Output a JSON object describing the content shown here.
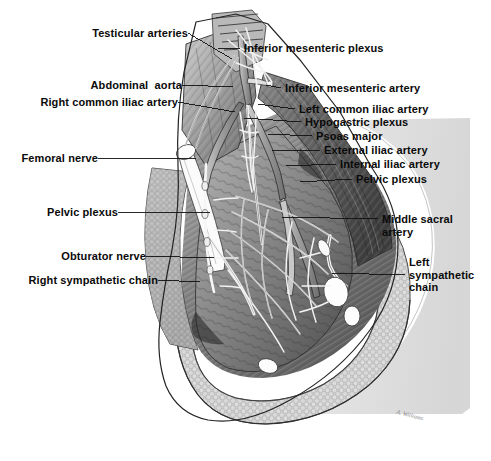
{
  "plate": {
    "title": "Posterior abdominal wall and pelvis — autonomic nerves and arteries",
    "background_color": "#ffffff",
    "ink_color": "#0a0a0a",
    "signature": "A. Williams"
  },
  "labels_left": [
    {
      "id": "testicular-arteries",
      "text": "Testicular arteries",
      "x": 74,
      "y": 27,
      "anchor_x": 188,
      "anchor_y": 33,
      "tip_x": 232,
      "tip_y": 59
    },
    {
      "id": "abdominal-aorta",
      "text": "Abdominal  aorta",
      "x": 85,
      "y": 79,
      "anchor_x": 182,
      "anchor_y": 85,
      "tip_x": 233,
      "tip_y": 87
    },
    {
      "id": "right-common-iliac",
      "text": "Right common iliac artery",
      "x": 21,
      "y": 96,
      "anchor_x": 178,
      "anchor_y": 102,
      "tip_x": 235,
      "tip_y": 112
    },
    {
      "id": "femoral-nerve",
      "text": "Femoral nerve",
      "x": 18,
      "y": 152,
      "anchor_x": 98,
      "anchor_y": 158,
      "tip_x": 196,
      "tip_y": 158
    },
    {
      "id": "pelvic-plexus-left",
      "text": "Pelvic plexus",
      "x": 41,
      "y": 206,
      "anchor_x": 118,
      "anchor_y": 212,
      "tip_x": 210,
      "tip_y": 212
    },
    {
      "id": "obturator-nerve",
      "text": "Obturator nerve",
      "x": 53,
      "y": 250,
      "anchor_x": 146,
      "anchor_y": 256,
      "tip_x": 214,
      "tip_y": 258
    },
    {
      "id": "right-sympathetic-chain",
      "text": "Right sympathetic chain",
      "x": 17,
      "y": 274,
      "anchor_x": 158,
      "anchor_y": 280,
      "tip_x": 200,
      "tip_y": 282
    }
  ],
  "labels_right": [
    {
      "id": "inferior-mesenteric-plexus",
      "text": "Inferior mesenteric plexus",
      "x": 244,
      "y": 42,
      "anchor_x": 240,
      "anchor_y": 48,
      "tip_x": 218,
      "tip_y": 48
    },
    {
      "id": "inferior-mesenteric-artery",
      "text": "Inferior mesenteric artery",
      "x": 285,
      "y": 82,
      "anchor_x": 281,
      "anchor_y": 88,
      "tip_x": 266,
      "tip_y": 85
    },
    {
      "id": "left-common-iliac",
      "text": "Left common iliac artery",
      "x": 299,
      "y": 103,
      "anchor_x": 295,
      "anchor_y": 109,
      "tip_x": 258,
      "tip_y": 104
    },
    {
      "id": "hypogastric-plexus",
      "text": "Hypogastric plexus",
      "x": 305,
      "y": 116,
      "anchor_x": 301,
      "anchor_y": 122,
      "tip_x": 244,
      "tip_y": 118
    },
    {
      "id": "psoas-major",
      "text": "Psoas major",
      "x": 316,
      "y": 130,
      "anchor_x": 312,
      "anchor_y": 136,
      "tip_x": 268,
      "tip_y": 134
    },
    {
      "id": "external-iliac-artery",
      "text": "External iliac artery",
      "x": 324,
      "y": 144,
      "anchor_x": 320,
      "anchor_y": 150,
      "tip_x": 272,
      "tip_y": 150
    },
    {
      "id": "internal-iliac-artery",
      "text": "Internal iliac artery",
      "x": 340,
      "y": 158,
      "anchor_x": 336,
      "anchor_y": 164,
      "tip_x": 286,
      "tip_y": 166
    },
    {
      "id": "pelvic-plexus-right",
      "text": "Pelvic plexus",
      "x": 356,
      "y": 173,
      "anchor_x": 352,
      "anchor_y": 179,
      "tip_x": 300,
      "tip_y": 182
    },
    {
      "id": "middle-sacral-artery",
      "text": "Middle sacral\nartery",
      "x": 382,
      "y": 213,
      "anchor_x": 378,
      "anchor_y": 219,
      "tip_x": 282,
      "tip_y": 217
    },
    {
      "id": "left-sympathetic-chain",
      "text": "Left\nsympathetic\nchain",
      "x": 409,
      "y": 256,
      "anchor_x": 405,
      "anchor_y": 275,
      "tip_x": 332,
      "tip_y": 273
    }
  ]
}
